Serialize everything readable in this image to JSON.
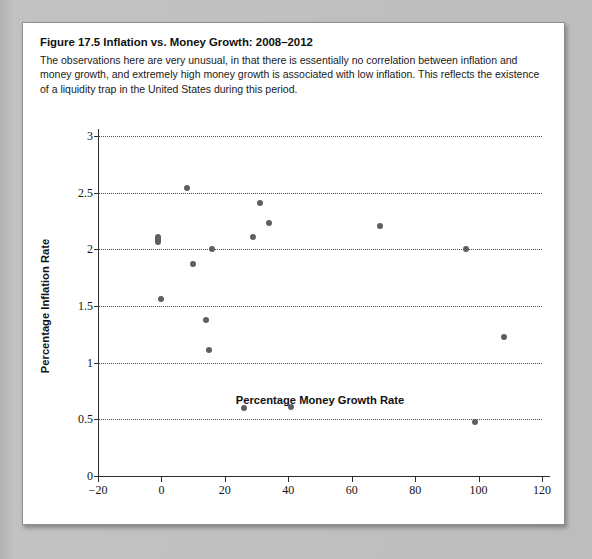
{
  "figure": {
    "label": "Figure 17.5",
    "title": "Inflation vs. Money Growth: 2008–2012",
    "caption": "The observations here are very unusual, in that there is essentially no correlation between inflation and money growth, and extremely high money growth is associated with low inflation. This reflects the existence of a liquidity trap in the United States during this period."
  },
  "chart_data": {
    "type": "scatter",
    "title": "Inflation vs. Money Growth: 2008–2012",
    "xlabel": "Percentage Money Growth Rate",
    "ylabel": "Percentage Inflation Rate",
    "xlim": [
      -20,
      120
    ],
    "ylim": [
      0,
      3
    ],
    "xticks": [
      -20,
      0,
      20,
      40,
      60,
      80,
      100,
      120
    ],
    "xtick_labels": [
      "−20",
      "0",
      "20",
      "40",
      "60",
      "80",
      "100",
      "120"
    ],
    "yticks": [
      0,
      0.5,
      1,
      1.5,
      2,
      2.5,
      3
    ],
    "ytick_labels": [
      "0",
      "0.5",
      "1",
      "1.5",
      "2",
      "2.5",
      "3"
    ],
    "gridlines": {
      "y": [
        0.5,
        1,
        1.5,
        2,
        2.5,
        3
      ],
      "x": []
    },
    "grid_style": "dotted-horizontal",
    "legend": null,
    "marker_color": "#5e5e63",
    "points": [
      {
        "x": -1,
        "y": 2.09,
        "overlapping": true
      },
      {
        "x": 0,
        "y": 1.56
      },
      {
        "x": 8,
        "y": 2.54
      },
      {
        "x": 10,
        "y": 1.87
      },
      {
        "x": 14,
        "y": 1.38
      },
      {
        "x": 15,
        "y": 1.11
      },
      {
        "x": 16,
        "y": 2.0
      },
      {
        "x": 26,
        "y": 0.6
      },
      {
        "x": 29,
        "y": 2.11
      },
      {
        "x": 31,
        "y": 2.41
      },
      {
        "x": 34,
        "y": 2.23
      },
      {
        "x": 41,
        "y": 0.61
      },
      {
        "x": 69,
        "y": 2.21
      },
      {
        "x": 96,
        "y": 2.0
      },
      {
        "x": 99,
        "y": 0.48
      },
      {
        "x": 108,
        "y": 1.23
      }
    ]
  }
}
